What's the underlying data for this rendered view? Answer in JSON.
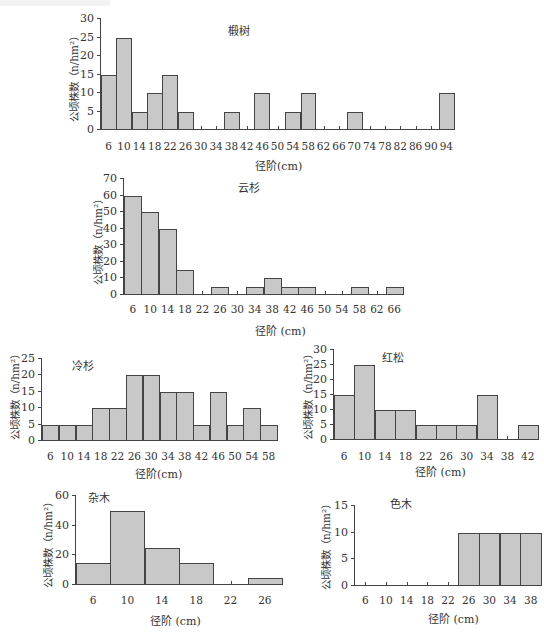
{
  "chart_data": [
    {
      "type": "bar",
      "title": "椴树",
      "xlabel": "径阶(cm)",
      "ylabel": "公顷株数（n/hm²）",
      "categories": [
        "6",
        "10",
        "14",
        "18",
        "22",
        "26",
        "30",
        "34",
        "38",
        "42",
        "46",
        "50",
        "54",
        "58",
        "62",
        "66",
        "70",
        "74",
        "78",
        "82",
        "86",
        "90",
        "94"
      ],
      "values": [
        15,
        25,
        5,
        10,
        15,
        5,
        0,
        0,
        5,
        0,
        10,
        0,
        5,
        10,
        0,
        0,
        5,
        0,
        0,
        0,
        0,
        0,
        10
      ],
      "ylim": [
        0,
        30
      ],
      "yticks": [
        0,
        5,
        10,
        15,
        20,
        25,
        30
      ],
      "grid": false
    },
    {
      "type": "bar",
      "title": "云杉",
      "xlabel": "径阶 (cm)",
      "ylabel": "公顷株数（n/hm²）",
      "categories": [
        "6",
        "10",
        "14",
        "18",
        "22",
        "26",
        "30",
        "34",
        "38",
        "42",
        "46",
        "50",
        "54",
        "58",
        "62",
        "66"
      ],
      "values": [
        60,
        50,
        40,
        15,
        0,
        5,
        0,
        5,
        10,
        5,
        5,
        0,
        0,
        5,
        0,
        5
      ],
      "ylim": [
        0,
        70
      ],
      "yticks": [
        0,
        10,
        20,
        30,
        40,
        50,
        60,
        70
      ],
      "grid": false
    },
    {
      "type": "bar",
      "title": "冷杉",
      "xlabel": "径阶(cm)",
      "ylabel": "公顷株数（n/hm²）",
      "categories": [
        "6",
        "10",
        "14",
        "18",
        "22",
        "26",
        "30",
        "34",
        "38",
        "42",
        "46",
        "50",
        "54",
        "58"
      ],
      "values": [
        5,
        5,
        5,
        10,
        10,
        20,
        20,
        15,
        15,
        5,
        15,
        5,
        10,
        5
      ],
      "ylim": [
        0,
        25
      ],
      "yticks": [
        0,
        5,
        10,
        15,
        20,
        25
      ],
      "grid": false
    },
    {
      "type": "bar",
      "title": "红松",
      "xlabel": "径阶 (cm)",
      "ylabel": "公顷株数（n/hm²）",
      "categories": [
        "6",
        "10",
        "14",
        "18",
        "22",
        "26",
        "30",
        "34",
        "38",
        "42"
      ],
      "values": [
        15,
        25,
        10,
        10,
        5,
        5,
        5,
        15,
        0,
        5
      ],
      "ylim": [
        0,
        30
      ],
      "yticks": [
        0,
        5,
        10,
        15,
        20,
        25,
        30
      ],
      "grid": false
    },
    {
      "type": "bar",
      "title": "杂木",
      "xlabel": "径阶 (cm)",
      "ylabel": "公顷株数（n/hm²）",
      "categories": [
        "6",
        "10",
        "14",
        "18",
        "22",
        "26"
      ],
      "values": [
        15,
        50,
        25,
        15,
        0,
        5
      ],
      "ylim": [
        0,
        60
      ],
      "yticks": [
        0,
        20,
        40,
        60
      ],
      "grid": false
    },
    {
      "type": "bar",
      "title": "色木",
      "xlabel": "径阶 (cm)",
      "ylabel": "公顷株数（n/hm²）",
      "categories": [
        "6",
        "10",
        "14",
        "18",
        "22",
        "26",
        "30",
        "34",
        "38"
      ],
      "values": [
        0,
        0,
        0,
        0,
        0,
        10,
        10,
        10,
        10
      ],
      "ylim": [
        0,
        15
      ],
      "yticks": [
        0,
        5,
        10,
        15
      ],
      "grid": false
    }
  ],
  "style": {
    "bar_fill": "#c8c8c8",
    "bar_edge": "#444444",
    "axis_color": "#444444"
  }
}
